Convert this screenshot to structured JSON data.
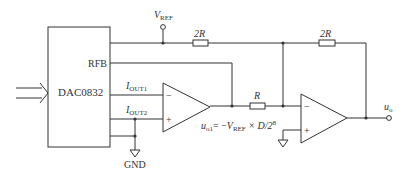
{
  "diagram": {
    "type": "circuit",
    "title": "",
    "chip": {
      "label": "DAC0832",
      "pins": {
        "rfb": "RFB",
        "iout1_main": "I",
        "iout1_sub": "OUT1",
        "iout2_main": "I",
        "iout2_sub": "OUT2"
      }
    },
    "vref": {
      "main": "V",
      "sub": "REF"
    },
    "resistors": [
      {
        "id": "r1",
        "label": "2R"
      },
      {
        "id": "r2",
        "label": "2R"
      },
      {
        "id": "r3",
        "label": "R"
      }
    ],
    "ground_label": "GND",
    "opamps": [
      {
        "id": "op1",
        "minus": "−",
        "plus": "+"
      },
      {
        "id": "op2",
        "minus": "−",
        "plus": "+"
      }
    ],
    "formula": {
      "lhs_main": "u",
      "lhs_sub": "o1",
      "eq": "= −",
      "v_main": "V",
      "v_sub": "REF",
      "rest": " × D/2",
      "exp": "8"
    },
    "output": {
      "main": "u",
      "sub": "o"
    },
    "colors": {
      "line": "#333333",
      "background": "#ffffff"
    }
  }
}
